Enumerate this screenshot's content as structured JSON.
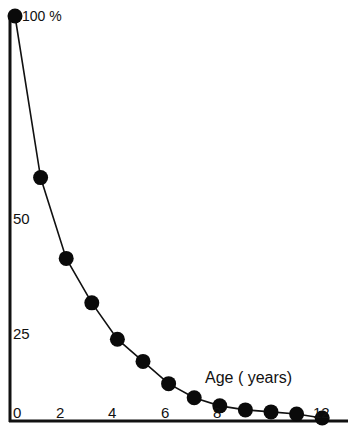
{
  "chart_data": {
    "type": "line",
    "title": "",
    "xlabel": "Age ( years)",
    "ylabel": "",
    "x": [
      0,
      1,
      2,
      3,
      4,
      5,
      6,
      7,
      8,
      9,
      10,
      11,
      12
    ],
    "series": [
      {
        "name": "survival",
        "values": [
          100,
          60,
          40,
          29,
          20,
          14.5,
          9,
          5.5,
          3.5,
          2.5,
          2,
          1.5,
          0.5
        ]
      }
    ],
    "xticks": [
      "0",
      "2",
      "4",
      "6",
      "8",
      "12"
    ],
    "yticks": [
      "100 %",
      "50",
      "25"
    ],
    "xlim": [
      0,
      13
    ],
    "ylim": [
      0,
      100
    ],
    "grid": false,
    "legend": "none"
  },
  "labels": {
    "y100": "100 %",
    "y50": "50",
    "y25": "25",
    "x0": "0",
    "x2": "2",
    "x4": "4",
    "x6": "6",
    "x8": "8",
    "x12": "12",
    "xlabel": "Age ( years)"
  }
}
